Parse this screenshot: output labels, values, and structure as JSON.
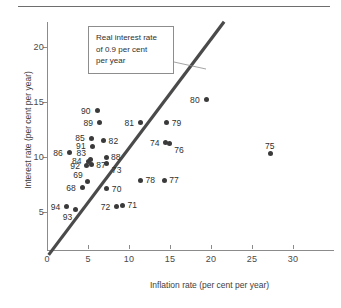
{
  "chart_data": {
    "type": "scatter",
    "title": "",
    "xlabel": "Inflation rate (per cent per year)",
    "ylabel": "Interest rate (per cent per year)",
    "xlim": [
      0,
      35
    ],
    "ylim": [
      0,
      23
    ],
    "xticks": [
      0,
      5,
      10,
      15,
      20,
      25,
      30
    ],
    "xtick_labels": [
      "0",
      "5",
      "10",
      "15",
      "20",
      "25",
      "30"
    ],
    "yticks": [
      5,
      10,
      15,
      20
    ],
    "ytick_labels": [
      "5",
      "10",
      "15",
      "20"
    ],
    "grid": false,
    "legend": "none",
    "annotation": {
      "text_lines": [
        "Real interest rate",
        "of 0.9 per cent",
        "per year"
      ],
      "points_to": "reference-line"
    },
    "reference_line": {
      "description": "Real interest rate of 0.9 per cent per year",
      "x_start": 0.2,
      "y_start": 1.1,
      "x_end": 21.6,
      "y_end": 22.3,
      "color": "#4a4a4a"
    },
    "point_color": "#3a3a3a",
    "points": [
      {
        "label": "94",
        "x": 2.4,
        "y": 5.5,
        "label_pos": "left"
      },
      {
        "label": "93",
        "x": 3.5,
        "y": 5.2,
        "label_pos": "below-left"
      },
      {
        "label": "86",
        "x": 2.7,
        "y": 10.4,
        "label_pos": "left"
      },
      {
        "label": "68",
        "x": 4.3,
        "y": 7.2,
        "label_pos": "left"
      },
      {
        "label": "69",
        "x": 4.9,
        "y": 7.8,
        "label_pos": "above-left"
      },
      {
        "label": "92",
        "x": 4.8,
        "y": 9.2,
        "label_pos": "left"
      },
      {
        "label": "84",
        "x": 5.0,
        "y": 9.6,
        "label_pos": "left"
      },
      {
        "label": "83",
        "x": 5.3,
        "y": 9.8,
        "label_pos": "above-left"
      },
      {
        "label": "87",
        "x": 5.4,
        "y": 9.3,
        "label_pos": "right"
      },
      {
        "label": "91",
        "x": 5.5,
        "y": 11.0,
        "label_pos": "left"
      },
      {
        "label": "85",
        "x": 5.4,
        "y": 11.7,
        "label_pos": "left"
      },
      {
        "label": "90",
        "x": 6.1,
        "y": 14.2,
        "label_pos": "left"
      },
      {
        "label": "89",
        "x": 6.4,
        "y": 13.1,
        "label_pos": "left"
      },
      {
        "label": "82",
        "x": 6.9,
        "y": 11.5,
        "label_pos": "right"
      },
      {
        "label": "88",
        "x": 7.2,
        "y": 10.0,
        "label_pos": "right"
      },
      {
        "label": "73",
        "x": 7.3,
        "y": 9.4,
        "label_pos": "below-right"
      },
      {
        "label": "70",
        "x": 7.3,
        "y": 7.1,
        "label_pos": "right"
      },
      {
        "label": "72",
        "x": 8.5,
        "y": 5.5,
        "label_pos": "left"
      },
      {
        "label": "71",
        "x": 9.2,
        "y": 5.6,
        "label_pos": "right"
      },
      {
        "label": "81",
        "x": 11.4,
        "y": 13.1,
        "label_pos": "left"
      },
      {
        "label": "78",
        "x": 11.4,
        "y": 7.9,
        "label_pos": "right"
      },
      {
        "label": "77",
        "x": 14.3,
        "y": 7.9,
        "label_pos": "right"
      },
      {
        "label": "74",
        "x": 14.5,
        "y": 11.3,
        "label_pos": "left"
      },
      {
        "label": "76",
        "x": 14.9,
        "y": 11.2,
        "label_pos": "below-right"
      },
      {
        "label": "79",
        "x": 14.6,
        "y": 13.1,
        "label_pos": "right"
      },
      {
        "label": "80",
        "x": 19.4,
        "y": 15.2,
        "label_pos": "left"
      },
      {
        "label": "75",
        "x": 27.2,
        "y": 10.3,
        "label_pos": "above"
      }
    ]
  }
}
